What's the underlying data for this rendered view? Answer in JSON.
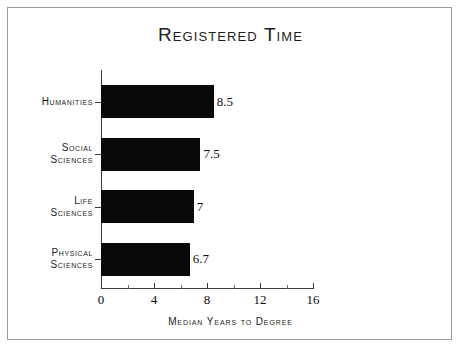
{
  "chart_data": {
    "type": "bar",
    "orientation": "horizontal",
    "title": "Registered Time",
    "xlabel": "Median Years to Degree",
    "ylabel": "",
    "categories": [
      "Humanities",
      "Social Sciences",
      "Life Sciences",
      "Physical Sciences"
    ],
    "category_lines": [
      [
        "Humanities"
      ],
      [
        "Social",
        "Sciences"
      ],
      [
        "Life",
        "Sciences"
      ],
      [
        "Physical",
        "Sciences"
      ]
    ],
    "values": [
      8.5,
      7.5,
      7,
      6.7
    ],
    "value_labels": [
      "8.5",
      "7.5",
      "7",
      "6.7"
    ],
    "xlim": [
      0,
      16
    ],
    "xticks": [
      0,
      4,
      8,
      12,
      16
    ],
    "xtick_labels": [
      "0",
      "4",
      "8",
      "12",
      "16"
    ],
    "x_minor_ticks": [
      2,
      6,
      10,
      14
    ],
    "grid": false,
    "legend": null,
    "bar_color": "#090909",
    "axis_color": "#3a3a3a",
    "text_color": "#1d1d1d",
    "background_color": "#ffffff",
    "frame_color": "#9a9a9a"
  }
}
